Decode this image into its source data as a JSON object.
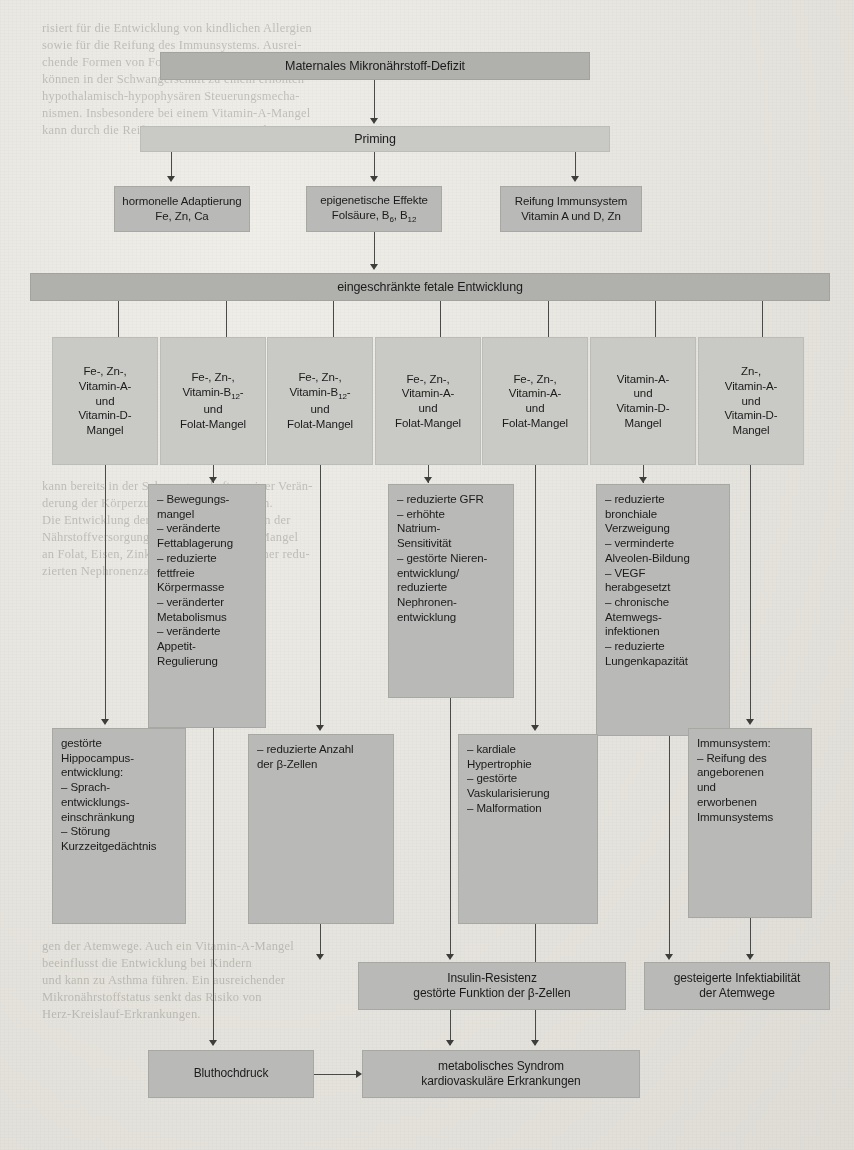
{
  "figure": {
    "type": "flowchart",
    "language": "de",
    "title": "Maternales Mikronährstoff-Defizit",
    "colors": {
      "box_dark": "#b0b0ad",
      "box_mid": "#b9b9b7",
      "box_light": "#c9c9c6",
      "connector": "#4a4a48",
      "page_background": "#e6e4de"
    },
    "nodes": {
      "root": "Maternales Mikronährstoff-Defizit",
      "priming": "Priming",
      "priming_children": [
        {
          "line1": "hormonelle Adaptierung",
          "line2": "Fe, Zn, Ca"
        },
        {
          "line1": "epigenetische Effekte",
          "line2": "Folsäure, B6, B12"
        },
        {
          "line1": "Reifung Immunsystem",
          "line2": "Vitamin A und D, Zn"
        }
      ],
      "fetal": "eingeschränkte fetale Entwicklung",
      "deficits": [
        "Fe-, Zn-,\nVitamin-A-\nund\nVitamin-D-\nMangel",
        "Fe-, Zn-,\nVitamin-B12-\nund\nFolat-Mangel",
        "Fe-, Zn-,\nVitamin-B12-\nund\nFolat-Mangel",
        "Fe-, Zn-,\nVitamin-A-\nund\nFolat-Mangel",
        "Fe-, Zn-,\nVitamin-A-\nund\nFolat-Mangel",
        "Vitamin-A-\nund\nVitamin-D-\nMangel",
        "Zn-,\nVitamin-A-\nund\nVitamin-D-\nMangel"
      ],
      "effects_metabolic": "– Bewegungs-\n   mangel\n– veränderte\n   Fettablagerung\n– reduzierte\n   fettfreie\n   Körpermasse\n– veränderter\n   Metabolismus\n– veränderte\n   Appetit-\n   Regulierung",
      "effects_renal": "– reduzierte GFR\n– erhöhte\n   Natrium-\n   Sensitivität\n– gestörte Nieren-\n   entwicklung/\n   reduzierte\n   Nephronen-\n   entwicklung",
      "effects_lung": "– reduzierte\n   bronchiale\n   Verzweigung\n– verminderte\n   Alveolen-Bildung\n– VEGF\n   herabgesetzt\n– chronische\n   Atemwegs-\n   infektionen\n– reduzierte\n   Lungenkapazität",
      "hippocampus": "gestörte\nHippocampus-\nentwicklung:\n– Sprach-\n   entwicklungs-\n   einschränkung\n– Störung\n   Kurzzeitgedächtnis",
      "beta_cells": "– reduzierte Anzahl\n   der β-Zellen",
      "cardiac": "– kardiale\n   Hypertrophie\n– gestörte\n   Vaskularisierung\n– Malformation",
      "immune": "Immunsystem:\n– Reifung des\n   angeborenen\n   und\n   erworbenen\n   Immunsystems",
      "insulin": "Insulin-Resistenz\ngestörte Funktion der β-Zellen",
      "infection": "gesteigerte Infektiabilität\nder Atemwege",
      "hypertension": "Bluthochdruck",
      "metabolic_syndrome": "metabolisches Syndrom\nkardiovaskuläre Erkrankungen"
    },
    "background_text": {
      "top": "risiert für die Entwicklung von kindlichen Allergien\nsowie für die Reifung des Immunsystems. Ausrei-\nchende Formen von Folat- und Vitamin-B12-Mangel\nkönnen in der Schwangerschaft zu einem erhöhten\nhypothalamisch-hypophysären Steuerungsmecha-\nnismen. Insbesondere bei einem Vitamin-A-Mangel\nkann durch die Reifung von Vitamin D und Zn",
      "middle": "kann bereits in der Schwangerschaft zu einer Verän-\nderung der Körperzusammensetzung führen.\nDie Entwicklung der Niere ist ebenfalls von der\nNährstoffversorgung abhängig. So ist ein Mangel\nan Folat, Eisen, Zink und Vitamin A mit einer redu-\nzierten Nephronenzahl assoziiert.",
      "bottom": "gen der Atemwege. Auch ein Vitamin-A-Mangel\nbeeinflusst die Entwicklung bei Kindern\nund kann zu Asthma führen. Ein ausreichender\nMikronährstoffstatus senkt das Risiko von\nHerz-Kreislauf-Erkrankungen."
    }
  }
}
